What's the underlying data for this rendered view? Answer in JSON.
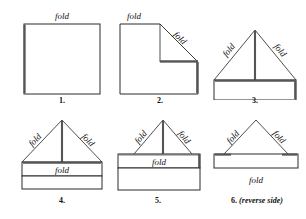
{
  "figure": {
    "steps": [
      {
        "number": "1.",
        "caption": "1.",
        "labels": [
          {
            "text": "fold",
            "position": "top-center"
          }
        ]
      },
      {
        "number": "2.",
        "caption": "2.",
        "labels": [
          {
            "text": "fold",
            "position": "top-left"
          },
          {
            "text": "fold",
            "position": "diagonal-right"
          }
        ]
      },
      {
        "number": "3.",
        "caption": "3.",
        "labels": [
          {
            "text": "fold",
            "position": "diagonal-left"
          },
          {
            "text": "fold",
            "position": "diagonal-right"
          }
        ]
      },
      {
        "number": "4.",
        "caption": "4.",
        "labels": [
          {
            "text": "fold",
            "position": "diagonal-left"
          },
          {
            "text": "fold",
            "position": "diagonal-right"
          },
          {
            "text": "fold",
            "position": "band-center"
          }
        ]
      },
      {
        "number": "5.",
        "caption": "5.",
        "labels": [
          {
            "text": "fold",
            "position": "diagonal-left"
          },
          {
            "text": "fold",
            "position": "diagonal-right"
          },
          {
            "text": "fold",
            "position": "band-center"
          }
        ]
      },
      {
        "number": "6.",
        "caption": "6. (reverse side)",
        "caption_number": "6.",
        "caption_note": "(reverse side)",
        "labels": [
          {
            "text": "fold",
            "position": "diagonal-left"
          },
          {
            "text": "fold",
            "position": "diagonal-right"
          },
          {
            "text": "fold",
            "position": "below-bar"
          }
        ]
      }
    ],
    "colors": {
      "background": "#ffffff",
      "stroke": "#2b2b2b",
      "shadow": "#555555",
      "text": "#111111"
    }
  }
}
